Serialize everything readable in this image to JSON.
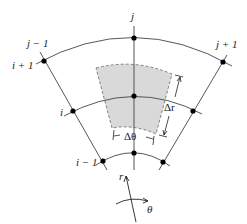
{
  "diagram": {
    "labels": {
      "j": "j",
      "j_minus_1": "j − 1",
      "j_plus_1": "j + 1",
      "i": "i",
      "i_plus_1": "i + 1",
      "i_minus_1": "i − 1",
      "delta_r": "Δr",
      "delta_theta": "Δθ",
      "r_axis": "r",
      "theta_axis": "θ"
    },
    "colors": {
      "line": "#444444",
      "node": "#000000",
      "cell_fill": "#d9d9d9",
      "cell_border": "#555555"
    }
  }
}
